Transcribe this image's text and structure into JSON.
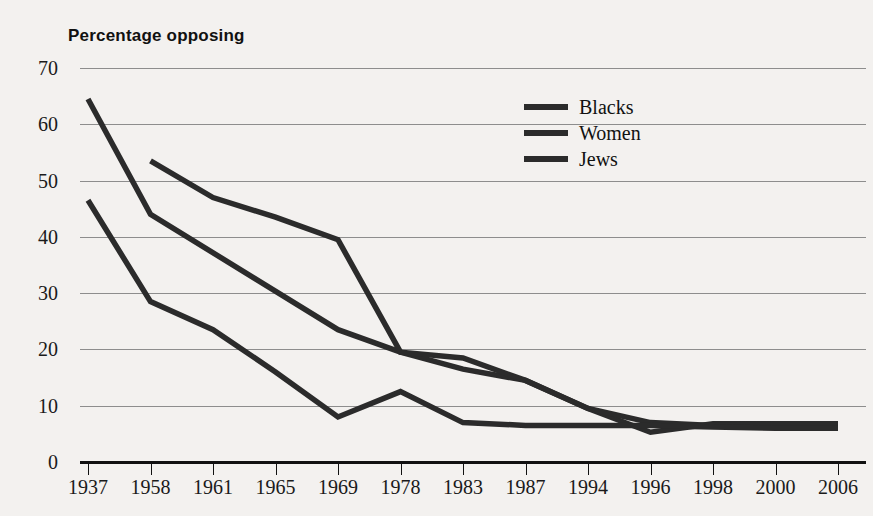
{
  "chart_data": {
    "type": "line",
    "title": "Percentage opposing",
    "xlabel": "",
    "ylabel": "",
    "ylim": [
      0,
      70
    ],
    "ytick_step": 10,
    "yticks": [
      70,
      60,
      50,
      40,
      30,
      20,
      10,
      0
    ],
    "grid": true,
    "legend_position": "upper-center-right",
    "categories": [
      "1937",
      "1958",
      "1961",
      "1965",
      "1969",
      "1978",
      "1983",
      "1987",
      "1994",
      "1996",
      "1998",
      "2000",
      "2006"
    ],
    "series": [
      {
        "name": "Blacks",
        "color": "#2b2b2b",
        "values": [
          64.5,
          44,
          null,
          null,
          23.5,
          19.5,
          16.5,
          14.5,
          9.5,
          5.3,
          6.8,
          6.8,
          null
        ]
      },
      {
        "name": "Women",
        "color": "#2b2b2b",
        "values": [
          null,
          53.5,
          47,
          43.5,
          39.5,
          19.5,
          18.5,
          14.5,
          9.5,
          7,
          6.5,
          6.8,
          6.8
        ]
      },
      {
        "name": "Jews",
        "color": "#2b2b2b",
        "values": [
          46.5,
          28.5,
          23.5,
          16,
          8,
          12.5,
          7,
          6.5,
          6.5,
          6.5,
          6.2,
          6,
          6
        ]
      }
    ]
  },
  "legend": {
    "items": [
      {
        "label": "Blacks"
      },
      {
        "label": "Women"
      },
      {
        "label": "Jews"
      }
    ]
  },
  "colors": {
    "background": "#f3f1ef",
    "line": "#2b2b2b",
    "grid": "#8d8d8d",
    "axis": "#111111",
    "text": "#1a1a1a"
  }
}
